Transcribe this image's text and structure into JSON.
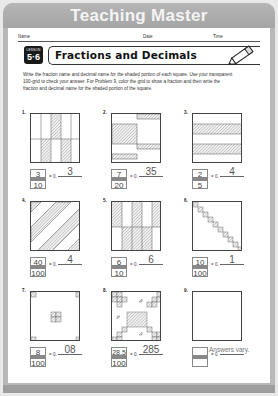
{
  "banner": {
    "title": "Teaching Master"
  },
  "header": {
    "name_label": "Name",
    "date_label": "Date",
    "time_label": "Time"
  },
  "lesson": {
    "label": "LESSON",
    "number": "5·6"
  },
  "title": "Fractions and Decimals",
  "instructions": "Write the fraction name and decimal name for the shaded portion of each square. Use your transparent 100-grid to check your answer. For Problem 9, color the grid to show a fraction and then write the fraction and decimal name for the shaded portion of the square.",
  "decimal_prefix": "= 0.",
  "problems": [
    {
      "number": "1.",
      "numerator": "3",
      "denominator": "10",
      "decimal": "3"
    },
    {
      "number": "2.",
      "numerator": "7",
      "denominator": "20",
      "decimal": "35"
    },
    {
      "number": "3.",
      "numerator": "2",
      "denominator": "5",
      "decimal": "4"
    },
    {
      "number": "4.",
      "numerator": "40",
      "denominator": "100",
      "decimal": "4"
    },
    {
      "number": "5.",
      "numerator": "6",
      "denominator": "10",
      "decimal": "6"
    },
    {
      "number": "6.",
      "numerator": "10",
      "denominator": "100",
      "decimal": "1"
    },
    {
      "number": "7.",
      "numerator": "8",
      "denominator": "100",
      "decimal": "08"
    },
    {
      "number": "8.",
      "numerator": "28.5",
      "denominator": "100",
      "decimal": "285"
    },
    {
      "number": "9.",
      "numerator": "",
      "denominator": "",
      "decimal": "",
      "note": "Answers vary."
    }
  ],
  "colors": {
    "banner": "#aaaaaa",
    "banner_text": "#f4f4f4",
    "hatch": "#888888",
    "answer_ink": "#555555"
  }
}
